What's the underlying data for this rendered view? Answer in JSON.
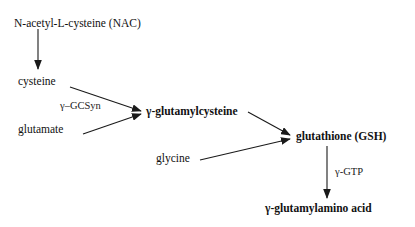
{
  "diagram": {
    "background_color": "#ffffff",
    "line_color": "#1a1a1a",
    "nodes": {
      "nac": {
        "label": "N-acetyl-L-cysteine (NAC)",
        "x": 14,
        "y": 18,
        "style": "regular"
      },
      "cysteine": {
        "label": "cysteine",
        "x": 18,
        "y": 76,
        "style": "regular"
      },
      "glutamate": {
        "label": "glutamate",
        "x": 18,
        "y": 124,
        "style": "regular"
      },
      "gamma_glutamylcysteine": {
        "label": "γ-glutamylcysteine",
        "x": 146,
        "y": 106,
        "style": "bold"
      },
      "glycine": {
        "label": "glycine",
        "x": 156,
        "y": 153,
        "style": "regular"
      },
      "glutathione": {
        "label": "glutathione (GSH)",
        "x": 296,
        "y": 131,
        "style": "bold"
      },
      "gamma_glutamylamino_acid": {
        "label": "γ-glutamylamino acid",
        "x": 265,
        "y": 203,
        "style": "bold"
      }
    },
    "enzymes": {
      "gcsyn": {
        "label": "γ–GCSyn",
        "x": 60,
        "y": 101
      },
      "ggtp": {
        "label": "γ-GTP",
        "x": 335,
        "y": 167
      }
    },
    "edges": [
      {
        "name": "nac-to-cysteine",
        "from": "nac",
        "to": "cysteine",
        "x1": 38,
        "y1": 29,
        "x2": 38,
        "y2": 69
      },
      {
        "name": "cysteine-to-gamma-glutamylcysteine",
        "from": "cysteine",
        "to": "gamma_glutamylcysteine",
        "x1": 70,
        "y1": 87,
        "x2": 141,
        "y2": 111
      },
      {
        "name": "glutamate-to-gamma-glutamylcysteine",
        "from": "glutamate",
        "to": "gamma_glutamylcysteine",
        "x1": 83,
        "y1": 134,
        "x2": 141,
        "y2": 113
      },
      {
        "name": "gamma-glutamylcysteine-to-glutathione",
        "from": "gamma_glutamylcysteine",
        "to": "glutathione",
        "x1": 248,
        "y1": 113,
        "x2": 290,
        "y2": 136
      },
      {
        "name": "glycine-to-glutathione",
        "from": "glycine",
        "to": "glutathione",
        "x1": 200,
        "y1": 160,
        "x2": 290,
        "y2": 138
      },
      {
        "name": "glutathione-to-gamma-glutamylamino-acid",
        "from": "glutathione",
        "to": "gamma_glutamylamino_acid",
        "x1": 327,
        "y1": 146,
        "x2": 327,
        "y2": 198
      }
    ]
  }
}
